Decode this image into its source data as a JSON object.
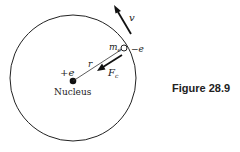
{
  "figure": {
    "caption": "Figure 28.9",
    "labels": {
      "nucleus": "Nucleus",
      "nucleus_charge": "+e",
      "radius": "r",
      "electron_mass": "m",
      "electron_mass_sub": "e",
      "electron_charge": "−e",
      "velocity": "v",
      "force": "F",
      "force_sub": "c"
    }
  }
}
